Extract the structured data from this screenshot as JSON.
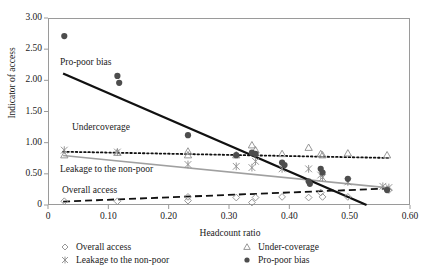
{
  "chart_data": {
    "type": "scatter",
    "title": "",
    "xlabel": "Headcount ratio",
    "ylabel": "Indicator of access",
    "xlim": [
      0,
      0.6
    ],
    "ylim": [
      0,
      3.0
    ],
    "xticks": [
      0,
      0.1,
      0.2,
      0.3,
      0.4,
      0.5,
      0.6
    ],
    "xtick_labels": [
      "0",
      "0.10",
      "0.20",
      "0.30",
      "0.40",
      "0.50",
      "0.60"
    ],
    "yticks": [
      0,
      0.5,
      1.0,
      1.5,
      2.0,
      2.5,
      3.0
    ],
    "ytick_labels": [
      "0",
      "0.50",
      "1.00",
      "1.50",
      "2.00",
      "2.50",
      "3.00"
    ],
    "grid": false,
    "legend_position": "below",
    "series": [
      {
        "name": "Overall access",
        "marker": "diamond-open",
        "color": "#8c8c8c",
        "trendline": {
          "style": "dashed",
          "color": "#111111",
          "width": 1.8,
          "x0": 0.025,
          "y0": 0.055,
          "x1": 0.565,
          "y1": 0.265
        },
        "points": [
          {
            "x": 0.027,
            "y": 0.06
          },
          {
            "x": 0.115,
            "y": 0.06
          },
          {
            "x": 0.232,
            "y": 0.13
          },
          {
            "x": 0.232,
            "y": 0.07
          },
          {
            "x": 0.312,
            "y": 0.12
          },
          {
            "x": 0.338,
            "y": 0.04
          },
          {
            "x": 0.344,
            "y": 0.12
          },
          {
            "x": 0.388,
            "y": 0.13
          },
          {
            "x": 0.432,
            "y": 0.12
          },
          {
            "x": 0.452,
            "y": 0.2
          },
          {
            "x": 0.455,
            "y": 0.13
          },
          {
            "x": 0.497,
            "y": 0.13
          },
          {
            "x": 0.562,
            "y": 0.25
          },
          {
            "x": 0.565,
            "y": 0.24
          }
        ]
      },
      {
        "name": "Under-coverage",
        "marker": "triangle-open",
        "color": "#8c8c8c",
        "trendline": {
          "style": "dotted",
          "color": "#111111",
          "width": 1.8,
          "x0": 0.025,
          "y0": 0.855,
          "x1": 0.565,
          "y1": 0.755
        },
        "points": [
          {
            "x": 0.027,
            "y": 0.8
          },
          {
            "x": 0.115,
            "y": 0.84
          },
          {
            "x": 0.232,
            "y": 0.86
          },
          {
            "x": 0.232,
            "y": 0.8
          },
          {
            "x": 0.312,
            "y": 0.8
          },
          {
            "x": 0.338,
            "y": 0.96
          },
          {
            "x": 0.344,
            "y": 0.88
          },
          {
            "x": 0.388,
            "y": 0.82
          },
          {
            "x": 0.432,
            "y": 0.92
          },
          {
            "x": 0.452,
            "y": 0.82
          },
          {
            "x": 0.455,
            "y": 0.8
          },
          {
            "x": 0.497,
            "y": 0.83
          },
          {
            "x": 0.562,
            "y": 0.8
          }
        ]
      },
      {
        "name": "Leakage to the non-poor",
        "marker": "x-star",
        "color": "#8c8c8c",
        "trendline": {
          "style": "solid",
          "color": "#a0a0a0",
          "width": 1.6,
          "x0": 0.025,
          "y0": 0.795,
          "x1": 0.565,
          "y1": 0.275
        },
        "points": [
          {
            "x": 0.027,
            "y": 0.88
          },
          {
            "x": 0.115,
            "y": 0.85
          },
          {
            "x": 0.232,
            "y": 0.65
          },
          {
            "x": 0.312,
            "y": 0.62
          },
          {
            "x": 0.338,
            "y": 0.6
          },
          {
            "x": 0.344,
            "y": 0.7
          },
          {
            "x": 0.388,
            "y": 0.58
          },
          {
            "x": 0.432,
            "y": 0.58
          },
          {
            "x": 0.452,
            "y": 0.48
          },
          {
            "x": 0.455,
            "y": 0.44
          },
          {
            "x": 0.497,
            "y": 0.37
          },
          {
            "x": 0.555,
            "y": 0.3
          },
          {
            "x": 0.565,
            "y": 0.28
          }
        ]
      },
      {
        "name": "Pro-poor bias",
        "marker": "circle-filled",
        "color": "#4d4d4d",
        "trendline": {
          "style": "solid",
          "color": "#111111",
          "width": 2.4,
          "x0": 0.025,
          "y0": 2.11,
          "x1": 0.528,
          "y1": 0.0
        },
        "points": [
          {
            "x": 0.027,
            "y": 2.71
          },
          {
            "x": 0.115,
            "y": 2.07
          },
          {
            "x": 0.118,
            "y": 1.96
          },
          {
            "x": 0.232,
            "y": 1.12
          },
          {
            "x": 0.312,
            "y": 0.8
          },
          {
            "x": 0.338,
            "y": 0.84
          },
          {
            "x": 0.344,
            "y": 0.82
          },
          {
            "x": 0.388,
            "y": 0.68
          },
          {
            "x": 0.392,
            "y": 0.64
          },
          {
            "x": 0.432,
            "y": 0.38
          },
          {
            "x": 0.434,
            "y": 0.34
          },
          {
            "x": 0.452,
            "y": 0.58
          },
          {
            "x": 0.455,
            "y": 0.52
          },
          {
            "x": 0.497,
            "y": 0.42
          },
          {
            "x": 0.562,
            "y": 0.24
          }
        ]
      }
    ],
    "annotations": [
      {
        "text": "Pro-poor bias",
        "x_px": 60,
        "y_px": 57
      },
      {
        "text": "Undercoverage",
        "x_px": 72,
        "y_px": 122
      },
      {
        "text": "Leakage to the non-poor",
        "x_px": 60,
        "y_px": 164
      },
      {
        "text": "Overall access",
        "x_px": 62,
        "y_px": 185
      }
    ]
  },
  "legend": {
    "entries": [
      {
        "label": "Overall access",
        "marker": "diamond-open",
        "color": "#8c8c8c"
      },
      {
        "label": "Under-coverage",
        "marker": "triangle-open",
        "color": "#8c8c8c"
      },
      {
        "label": "Leakage to the non-poor",
        "marker": "x-star",
        "color": "#8c8c8c"
      },
      {
        "label": "Pro-poor bias",
        "marker": "circle-filled",
        "color": "#4d4d4d"
      }
    ]
  },
  "colors": {
    "axis": "#9a9a9a",
    "text": "#1a1a1a",
    "gray_marker": "#8c8c8c",
    "dark_marker": "#4d4d4d",
    "gray_line": "#a0a0a0",
    "black_line": "#111111"
  }
}
